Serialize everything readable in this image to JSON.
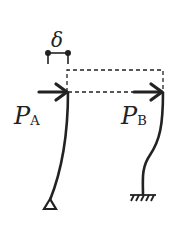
{
  "diagram": {
    "type": "structural-sway-columns",
    "colors": {
      "stroke": "#222222",
      "background": "#ffffff"
    },
    "displacement": {
      "symbol": "δ"
    },
    "columns": [
      {
        "id": "A",
        "load_symbol": "P",
        "load_subscript": "A",
        "support": "pin"
      },
      {
        "id": "B",
        "load_symbol": "P",
        "load_subscript": "B",
        "support": "fixed"
      }
    ]
  }
}
